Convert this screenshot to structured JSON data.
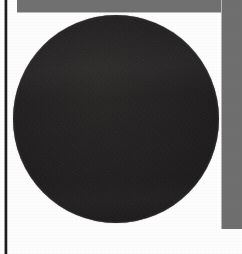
{
  "page": {
    "width": 242,
    "height": 254,
    "background_color": "#fdfdfd",
    "description": "Scanned page fragment: a large solid dark circle on white paper, bounded by a gray margin band along the top and right edges and a thin dark vertical rule near the left edge."
  },
  "figure": {
    "name": "dark-circle",
    "shape": "circle",
    "fill_color": "#232121",
    "center_x": 116,
    "center_y": 119,
    "radius_x": 103,
    "radius_y": 104,
    "left": 13,
    "top": 15,
    "width": 206,
    "height": 208,
    "label": ""
  },
  "margins": {
    "top_band": {
      "name": "top-gray-band",
      "color": "#707070",
      "left": 17,
      "top": 0,
      "width": 225,
      "height": 12
    },
    "right_band": {
      "name": "right-gray-band",
      "color": "#6f6f6f",
      "left": 222,
      "top": 0,
      "width": 20,
      "height": 229
    },
    "left_rule": {
      "name": "left-binding-rule",
      "color": "#1d1d1d",
      "left": 5,
      "top": 0,
      "width": 2,
      "height": 254
    }
  },
  "colors": {
    "paper": "#fdfdfd",
    "band_gray": "#6f6f6f",
    "rule_dark": "#1d1d1d",
    "circle_dark": "#232121"
  }
}
